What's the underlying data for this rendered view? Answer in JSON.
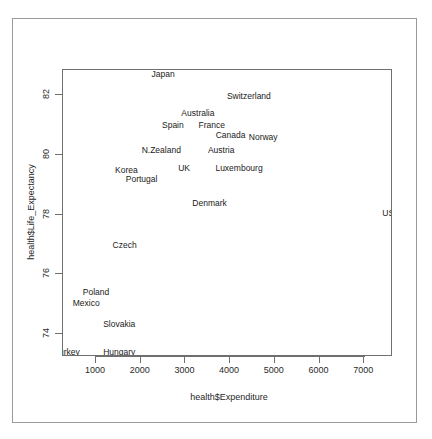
{
  "chart_data": {
    "type": "scatter",
    "title": "",
    "xlabel": "health$Expenditure",
    "ylabel": "health$Life_Expectancy",
    "xlim": [
      260,
      7660
    ],
    "ylim": [
      73.2,
      83.1
    ],
    "xticks": [
      1000,
      2000,
      3000,
      4000,
      5000,
      6000,
      7000
    ],
    "yticks": [
      74,
      76,
      78,
      80,
      82
    ],
    "grid": false,
    "legend": "none",
    "marker_style": "text-labels",
    "points": [
      {
        "label": "Japan",
        "x": 2500,
        "y": 82.7
      },
      {
        "label": "Switzerland",
        "x": 4420,
        "y": 81.95
      },
      {
        "label": "Australia",
        "x": 3280,
        "y": 81.4
      },
      {
        "label": "Spain",
        "x": 2720,
        "y": 81.0
      },
      {
        "label": "France",
        "x": 3590,
        "y": 81.0
      },
      {
        "label": "Canada",
        "x": 4010,
        "y": 80.65
      },
      {
        "label": "Norway",
        "x": 4740,
        "y": 80.6
      },
      {
        "label": "N.Zealand",
        "x": 2460,
        "y": 80.15
      },
      {
        "label": "Austria",
        "x": 3800,
        "y": 80.15
      },
      {
        "label": "Korea",
        "x": 1680,
        "y": 79.5
      },
      {
        "label": "UK",
        "x": 2970,
        "y": 79.55
      },
      {
        "label": "Luxembourg",
        "x": 4200,
        "y": 79.55
      },
      {
        "label": "Portugal",
        "x": 2020,
        "y": 79.2
      },
      {
        "label": "Denmark",
        "x": 3540,
        "y": 78.4
      },
      {
        "label": "USA",
        "x": 7600,
        "y": 78.05
      },
      {
        "label": "Czech",
        "x": 1640,
        "y": 77.0
      },
      {
        "label": "Poland",
        "x": 1000,
        "y": 75.4
      },
      {
        "label": "Mexico",
        "x": 780,
        "y": 75.05
      },
      {
        "label": "Slovakia",
        "x": 1520,
        "y": 74.35
      },
      {
        "label": "Turkey",
        "x": 350,
        "y": 73.4
      },
      {
        "label": "Hungary",
        "x": 1520,
        "y": 73.4
      }
    ]
  },
  "colors": {
    "background": "#ffffff",
    "outer_border": "#9a9a9a",
    "plot_border": "#6f6f6f",
    "axis": "#6f6f6f",
    "text": "#1a1a1a"
  }
}
